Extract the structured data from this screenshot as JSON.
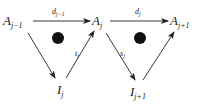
{
  "diagram": {
    "nodes": [
      {
        "id": "A_prev",
        "base": "A",
        "sub": "j−1"
      },
      {
        "id": "A_cur",
        "base": "A",
        "sub": "j"
      },
      {
        "id": "A_next",
        "base": "A",
        "sub": "j+1"
      },
      {
        "id": "I_cur",
        "base": "I",
        "sub": "j"
      },
      {
        "id": "I_next",
        "base": "I",
        "sub": "j+1"
      }
    ],
    "edges": [
      {
        "from": "A_prev",
        "to": "A_cur",
        "base": "d",
        "sub": "j−1"
      },
      {
        "from": "A_cur",
        "to": "A_next",
        "base": "d",
        "sub": "j"
      },
      {
        "from": "A_prev",
        "to": "I_cur",
        "base": "",
        "sub": ""
      },
      {
        "from": "I_cur",
        "to": "A_cur",
        "base": "t",
        "sub": "j"
      },
      {
        "from": "A_cur",
        "to": "I_next",
        "base": "s",
        "sub": "j"
      },
      {
        "from": "I_next",
        "to": "A_next",
        "base": "",
        "sub": ""
      }
    ],
    "faces": [
      {
        "id": "face-left",
        "marker": "filled-dot"
      },
      {
        "id": "face-right",
        "marker": "filled-dot"
      }
    ],
    "colors": {
      "ink": "#222222",
      "dot": "#111111"
    }
  }
}
